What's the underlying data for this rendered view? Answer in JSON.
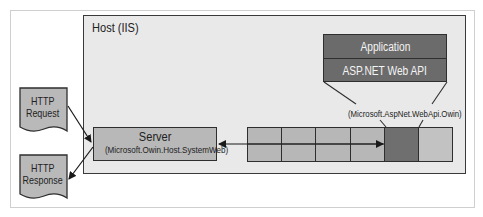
{
  "diagram": {
    "host": {
      "label": "Host (IIS)"
    },
    "application": {
      "title": "Application",
      "framework": "ASP.NET Web API"
    },
    "owin_adapter_label": "(Microsoft.AspNet.WebApi.Owin)",
    "server": {
      "title": "Server",
      "subtitle": "(Microsoft.Owin.Host.SystemWeb)"
    },
    "pipeline": {
      "cells": [
        {
          "kind": "middleware",
          "shade": "light"
        },
        {
          "kind": "middleware",
          "shade": "light"
        },
        {
          "kind": "middleware",
          "shade": "light"
        },
        {
          "kind": "middleware",
          "shade": "light"
        },
        {
          "kind": "web-api-adapter",
          "shade": "dark"
        },
        {
          "kind": "end",
          "shade": "light"
        }
      ],
      "split_rows": 2
    },
    "documents": {
      "request": {
        "line1": "HTTP",
        "line2": "Request"
      },
      "response": {
        "line1": "HTTP",
        "line2": "Response"
      }
    },
    "colors": {
      "host_fill": "#e9e9e9",
      "app_fill": "#6b6b6b",
      "cell_fill": "#b9b9b9",
      "dark_cell_fill": "#6f6f6f",
      "border": "#2e2e2e"
    }
  }
}
